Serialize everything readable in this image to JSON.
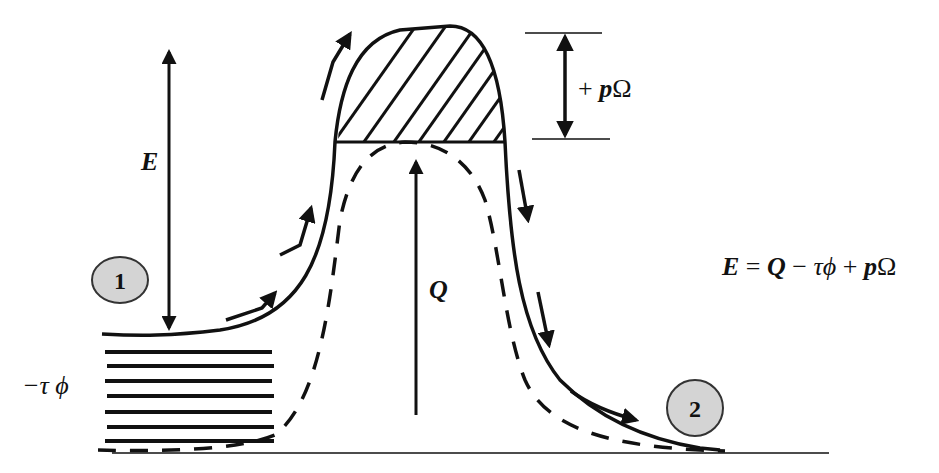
{
  "diagram": {
    "title": "",
    "labels": {
      "energy": "E",
      "heat": "Q",
      "work_term": "+ pΩ",
      "work_term_plus": "+ ",
      "work_term_p": "p",
      "work_term_omega": "Ω",
      "shear_term": "−τ ϕ",
      "equation_E": "E",
      "equation_eq": " = ",
      "equation_Q": "Q",
      "equation_minus": " − ",
      "equation_tau_phi": "τϕ",
      "equation_plus": " + ",
      "equation_p": "p",
      "equation_omega": "Ω"
    },
    "equation": "E = Q − τϕ + pΩ",
    "states": [
      {
        "id": "state-1",
        "label": "1"
      },
      {
        "id": "state-2",
        "label": "2"
      }
    ],
    "colors": {
      "stroke": "#111111",
      "state_fill": "#d4d4d4",
      "background": "#ffffff"
    }
  }
}
